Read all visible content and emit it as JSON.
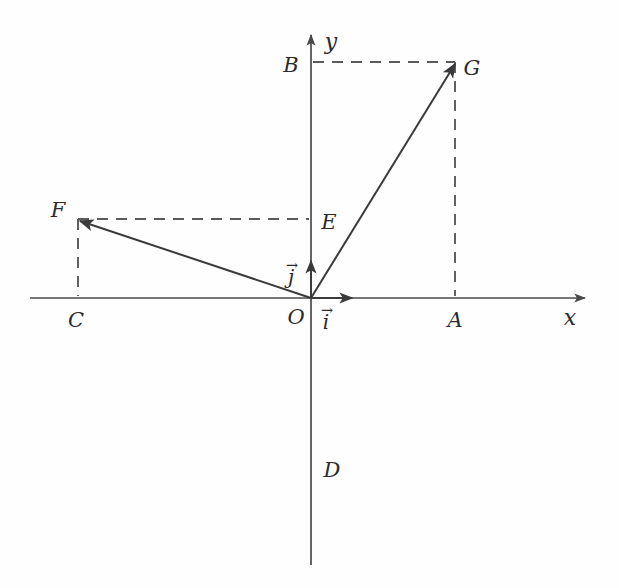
{
  "figure": {
    "background_color": "#fefefe",
    "stroke_color": "#4a4a4a",
    "text_color": "#2b2b2b",
    "width": 619,
    "height": 588
  },
  "axes": {
    "x": {
      "label": "x",
      "label_x": 570,
      "label_y": 318,
      "x_start": 30,
      "x_end": 585,
      "y": 298,
      "arrow": "right"
    },
    "y": {
      "label": "y",
      "label_x": 331,
      "label_y": 42,
      "y_start": 565,
      "y_end": 35,
      "x": 311,
      "arrow": "up"
    },
    "origin": {
      "label": "O",
      "x": 311,
      "y": 298,
      "label_x": 296,
      "label_y": 317
    }
  },
  "points": [
    {
      "name": "A",
      "label": "A",
      "x": 455,
      "y": 298,
      "label_x": 455,
      "label_y": 320,
      "on": "x-axis"
    },
    {
      "name": "B",
      "label": "B",
      "x": 311,
      "y": 62,
      "label_x": 291,
      "label_y": 65,
      "on": "y-axis"
    },
    {
      "name": "C",
      "label": "C",
      "x": 78,
      "y": 298,
      "label_x": 76,
      "label_y": 320,
      "on": "x-axis"
    },
    {
      "name": "D",
      "label": "D",
      "x": 311,
      "y": 470,
      "label_x": 332,
      "label_y": 470,
      "on": "y-axis"
    },
    {
      "name": "E",
      "label": "E",
      "x": 311,
      "y": 219,
      "label_x": 329,
      "label_y": 222,
      "on": "y-axis"
    },
    {
      "name": "F",
      "label": "F",
      "x": 78,
      "y": 219,
      "label_x": 58,
      "label_y": 210,
      "on": "plane"
    },
    {
      "name": "G",
      "label": "G",
      "x": 455,
      "y": 62,
      "label_x": 472,
      "label_y": 68,
      "on": "plane"
    }
  ],
  "vectors": [
    {
      "name": "OG",
      "from": "O",
      "to": "G",
      "x1": 311,
      "y1": 298,
      "x2": 455,
      "y2": 64,
      "arrow_at": "end"
    },
    {
      "name": "OF",
      "from": "O",
      "to": "F",
      "x1": 311,
      "y1": 298,
      "x2": 80,
      "y2": 221,
      "arrow_at": "end"
    }
  ],
  "unit_vectors": [
    {
      "name": "i",
      "label": "i",
      "accent": "→",
      "x1": 311,
      "y1": 298,
      "x2": 352,
      "y2": 298,
      "label_x": 326,
      "label_y": 322
    },
    {
      "name": "j",
      "label": "j",
      "accent": "→",
      "x1": 311,
      "y1": 298,
      "x2": 311,
      "y2": 261,
      "label_x": 291,
      "label_y": 277
    }
  ],
  "projection_lines": [
    {
      "name": "B-to-G",
      "x1": 313,
      "y1": 62,
      "x2": 455,
      "y2": 62,
      "style": "dashed"
    },
    {
      "name": "G-to-A",
      "x1": 455,
      "y1": 62,
      "x2": 455,
      "y2": 296,
      "style": "dashed"
    },
    {
      "name": "F-to-E",
      "x1": 78,
      "y1": 219,
      "x2": 309,
      "y2": 219,
      "style": "dashed"
    },
    {
      "name": "F-to-C",
      "x1": 78,
      "y1": 219,
      "x2": 78,
      "y2": 296,
      "style": "dashed"
    }
  ]
}
